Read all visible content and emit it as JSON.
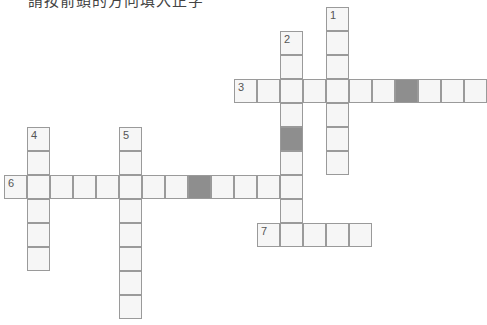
{
  "instruction": "請按箭頭的方向填入正字",
  "grid": {
    "cell_width": 23,
    "cell_height": 24,
    "origin_x": 4,
    "origin_y": 7,
    "colors": {
      "cell_fill": "#f6f6f6",
      "cell_border": "#9a9a9a",
      "block_fill": "#8e8e8e"
    }
  },
  "clues": [
    {
      "number": "1",
      "direction": "down",
      "row": 0,
      "col": 14,
      "length": 7,
      "blocks": []
    },
    {
      "number": "2",
      "direction": "down",
      "row": 1,
      "col": 12,
      "length": 9,
      "blocks": [
        4
      ]
    },
    {
      "number": "3",
      "direction": "across",
      "row": 3,
      "col": 10,
      "length": 11,
      "blocks": [
        7
      ]
    },
    {
      "number": "4",
      "direction": "down",
      "row": 5,
      "col": 1,
      "length": 6,
      "blocks": []
    },
    {
      "number": "5",
      "direction": "down",
      "row": 5,
      "col": 5,
      "length": 8,
      "blocks": []
    },
    {
      "number": "6",
      "direction": "across",
      "row": 7,
      "col": 0,
      "length": 13,
      "blocks": [
        8
      ]
    },
    {
      "number": "7",
      "direction": "across",
      "row": 9,
      "col": 11,
      "length": 5,
      "blocks": []
    }
  ]
}
